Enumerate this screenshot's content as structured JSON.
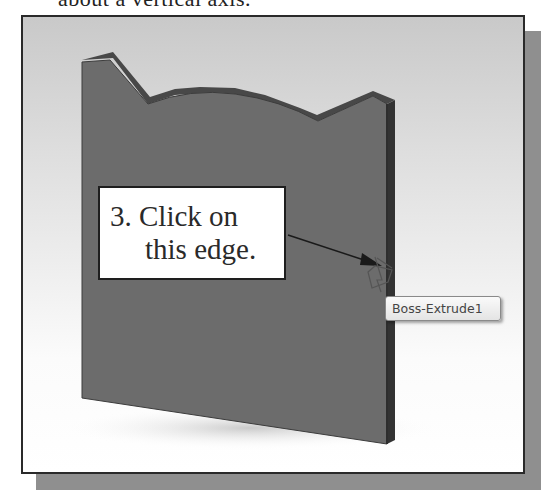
{
  "caption": {
    "text": "about a vertical axis."
  },
  "viewport": {
    "background_top": "#c9c9c9",
    "background_bottom": "#ffffff",
    "part": {
      "name": "Boss-Extrude1",
      "front_face_color": "#6e6e6e",
      "top_face_color": "#4a4a4a",
      "side_face_color": "#3a3a3a"
    }
  },
  "callout": {
    "line1": "3. Click on",
    "line2": "this edge."
  },
  "tooltip": {
    "label": "Boss-Extrude1"
  },
  "cursor": {
    "icon": "edge-select-cursor-icon"
  }
}
